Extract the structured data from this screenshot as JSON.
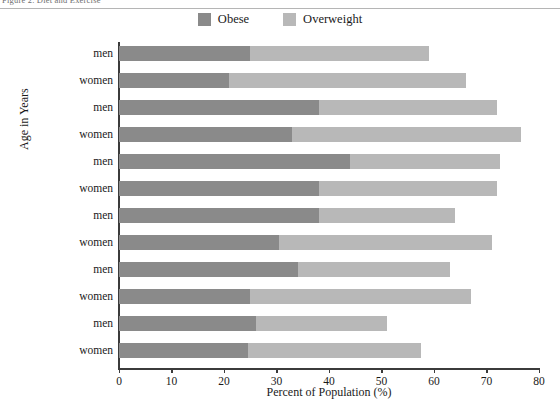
{
  "caption": {
    "text": "Figure 2. Diet and Exercise"
  },
  "legend": {
    "position": "top-center",
    "items": [
      {
        "label": "Obese",
        "color": "#8a8a8a",
        "swatch_name": "legend-swatch-obese"
      },
      {
        "label": "Overweight",
        "color": "#b8b8b8",
        "swatch_name": "legend-swatch-overweight"
      }
    ]
  },
  "axes": {
    "xlabel": "Percent of Population (%)",
    "ylabel": "Age in Years",
    "xticks": [
      0,
      10,
      20,
      30,
      40,
      50,
      60,
      70,
      80
    ],
    "xlim": [
      0,
      80
    ],
    "grid": false
  },
  "chart_data": {
    "type": "bar",
    "orientation": "horizontal",
    "stacked": true,
    "title": "",
    "xlabel": "Percent of Population (%)",
    "ylabel": "Age in Years",
    "xlim": [
      0,
      80
    ],
    "xticks": [
      0,
      10,
      20,
      30,
      40,
      50,
      60,
      70,
      80
    ],
    "grid": false,
    "legend_position": "top-center",
    "categories": [
      "75+ men",
      "75+ women",
      "65-74 men",
      "65-74 women",
      "55-64 men",
      "55-64 women",
      "45-54 men",
      "45-54 women",
      "35-44 men",
      "35-44 women",
      "20-34 men",
      "20-34 women"
    ],
    "age_groups": [
      "75+",
      "65-74",
      "55-64",
      "45-54",
      "35-44",
      "20-34"
    ],
    "series": [
      {
        "name": "Obese",
        "color": "#8a8a8a",
        "values": [
          25.0,
          21.0,
          38.0,
          33.0,
          44.0,
          38.0,
          38.0,
          30.5,
          34.0,
          25.0,
          26.0,
          24.5
        ]
      },
      {
        "name": "Overweight",
        "color": "#b8b8b8",
        "values": [
          34.0,
          45.0,
          34.0,
          43.5,
          28.5,
          34.0,
          26.0,
          40.5,
          29.0,
          42.0,
          25.0,
          33.0
        ]
      }
    ],
    "totals": [
      59.0,
      66.0,
      72.0,
      76.5,
      72.5,
      72.0,
      64.0,
      71.0,
      63.0,
      67.0,
      51.0,
      57.5
    ]
  },
  "rows": [
    {
      "group": "75+",
      "sex": "men",
      "obese": 25.0,
      "overweight": 34.0,
      "total": 59.0
    },
    {
      "group": "75+",
      "sex": "women",
      "obese": 21.0,
      "overweight": 45.0,
      "total": 66.0
    },
    {
      "group": "65-74",
      "sex": "men",
      "obese": 38.0,
      "overweight": 34.0,
      "total": 72.0
    },
    {
      "group": "65-74",
      "sex": "women",
      "obese": 33.0,
      "overweight": 43.5,
      "total": 76.5
    },
    {
      "group": "55-64",
      "sex": "men",
      "obese": 44.0,
      "overweight": 28.5,
      "total": 72.5
    },
    {
      "group": "55-64",
      "sex": "women",
      "obese": 38.0,
      "overweight": 34.0,
      "total": 72.0
    },
    {
      "group": "45-54",
      "sex": "men",
      "obese": 38.0,
      "overweight": 26.0,
      "total": 64.0
    },
    {
      "group": "45-54",
      "sex": "women",
      "obese": 30.5,
      "overweight": 40.5,
      "total": 71.0
    },
    {
      "group": "35-44",
      "sex": "men",
      "obese": 34.0,
      "overweight": 29.0,
      "total": 63.0
    },
    {
      "group": "35-44",
      "sex": "women",
      "obese": 25.0,
      "overweight": 42.0,
      "total": 67.0
    },
    {
      "group": "20-34",
      "sex": "men",
      "obese": 26.0,
      "overweight": 25.0,
      "total": 51.0
    },
    {
      "group": "20-34",
      "sex": "women",
      "obese": 24.5,
      "overweight": 33.0,
      "total": 57.5
    }
  ],
  "group_labels": [
    "75+",
    "65–74",
    "55–64",
    "45–54",
    "35–44",
    "20–34"
  ],
  "colors": {
    "obese": "#8a8a8a",
    "overweight": "#b8b8b8",
    "axis": "#3b3b3b",
    "background": "#ffffff"
  }
}
